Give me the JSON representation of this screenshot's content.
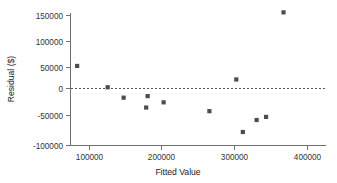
{
  "chart_data": {
    "type": "scatter",
    "title": "",
    "xlabel": "Fitted Value",
    "ylabel": "Residual ($)",
    "xlim": [
      62000,
      420000
    ],
    "ylim": [
      -112000,
      165000
    ],
    "xticks": [
      100000,
      200000,
      300000,
      400000
    ],
    "xtick_labels": [
      "100000",
      "200000",
      "300000",
      "400000"
    ],
    "yticks": [
      -100000,
      -50000,
      0,
      50000,
      100000,
      150000
    ],
    "ytick_labels": [
      "-100000",
      "-50000",
      "0",
      "50000",
      "100000",
      "150000"
    ],
    "grid": false,
    "legend": null,
    "reference_lines": [
      {
        "name": "zero-residual-line",
        "orientation": "horizontal",
        "value": 0,
        "style": "dashed"
      }
    ],
    "series": [
      {
        "name": "residuals",
        "marker": "square",
        "color": "#4d4d4d",
        "points": [
          {
            "x": 83000,
            "y": 53000
          },
          {
            "x": 125000,
            "y": 12000
          },
          {
            "x": 147000,
            "y": -8000
          },
          {
            "x": 178000,
            "y": -27000
          },
          {
            "x": 180000,
            "y": -5000
          },
          {
            "x": 202000,
            "y": -17000
          },
          {
            "x": 265000,
            "y": -34000
          },
          {
            "x": 302000,
            "y": 27000
          },
          {
            "x": 311000,
            "y": -74000
          },
          {
            "x": 330000,
            "y": -51000
          },
          {
            "x": 343000,
            "y": -45000
          },
          {
            "x": 367000,
            "y": 156000
          }
        ]
      }
    ]
  },
  "axes": {
    "x_axis_name": "fitted-value-axis",
    "y_axis_name": "residual-axis"
  }
}
